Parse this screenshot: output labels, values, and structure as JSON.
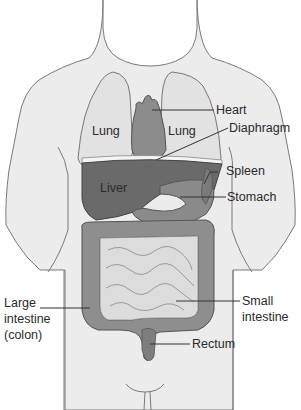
{
  "diagram": {
    "colors": {
      "body_fill": "#ececec",
      "body_outline": "#7a7a7a",
      "lung_fill": "#e2e2e2",
      "heart_fill": "#8c8c8c",
      "liver_fill": "#6a6a6a",
      "stomach_fill": "#8a8a8a",
      "colon_fill": "#8e8e8e",
      "small_intestine_fill": "#dcdcdc",
      "leader_line": "#333333",
      "label_text": "#2a2a2a"
    },
    "labels": {
      "lung_left": "Lung",
      "lung_right": "Lung",
      "liver": "Liver",
      "heart": "Heart",
      "diaphragm": "Diaphragm",
      "spleen": "Spleen",
      "stomach": "Stomach",
      "large_intestine": [
        "Large",
        "intestine",
        "(colon)"
      ],
      "small_intestine": [
        "Small",
        "intestine"
      ],
      "rectum": "Rectum"
    }
  }
}
